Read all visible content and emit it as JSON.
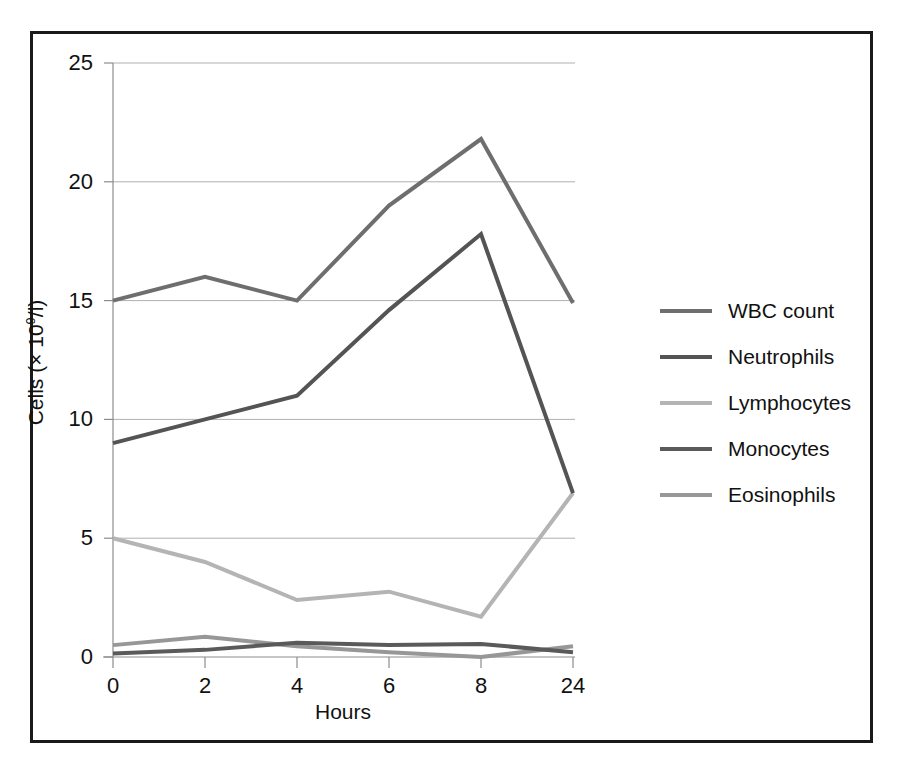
{
  "chart_data": {
    "type": "line",
    "title": "",
    "xlabel": "Hours",
    "ylabel": "Cells (× 10⁹/l)",
    "ylabel_prefix": "Cells (× 10",
    "ylabel_exponent": "9",
    "ylabel_suffix": "/l)",
    "categories": [
      "0",
      "2",
      "4",
      "6",
      "8",
      "24"
    ],
    "x_tick_labels": [
      "0",
      "2",
      "4",
      "6",
      "8",
      "24"
    ],
    "y_tick_labels": [
      "25",
      "20",
      "15",
      "10",
      "5",
      "0"
    ],
    "ylim": [
      0,
      25
    ],
    "y_ticks": [
      0,
      5,
      10,
      15,
      20,
      25
    ],
    "grid": "horizontal",
    "legend_position": "right",
    "series": [
      {
        "name": "WBC count",
        "color": "#6e6e6e",
        "values": [
          15.0,
          16.0,
          15.0,
          19.0,
          21.8,
          14.9
        ]
      },
      {
        "name": "Neutrophils",
        "color": "#545454",
        "values": [
          9.0,
          10.0,
          11.0,
          14.6,
          17.8,
          6.9
        ]
      },
      {
        "name": "Lymphocytes",
        "color": "#b4b4b4",
        "values": [
          5.0,
          4.0,
          2.4,
          2.75,
          1.7,
          6.9
        ]
      },
      {
        "name": "Monocytes",
        "color": "#5a5a5a",
        "values": [
          0.15,
          0.3,
          0.6,
          0.5,
          0.55,
          0.2
        ]
      },
      {
        "name": "Eosinophils",
        "color": "#979797",
        "values": [
          0.5,
          0.85,
          0.45,
          0.2,
          0.0,
          0.45
        ]
      }
    ]
  },
  "legend": {
    "items": [
      {
        "label": "WBC count"
      },
      {
        "label": "Neutrophils"
      },
      {
        "label": "Lymphocytes"
      },
      {
        "label": "Monocytes"
      },
      {
        "label": "Eosinophils"
      }
    ]
  },
  "colors": {
    "frame": "#1a1a1a",
    "axis": "#8c8c8c",
    "grid": "#b0b0b0",
    "background": "#ffffff",
    "text": "#111111"
  }
}
